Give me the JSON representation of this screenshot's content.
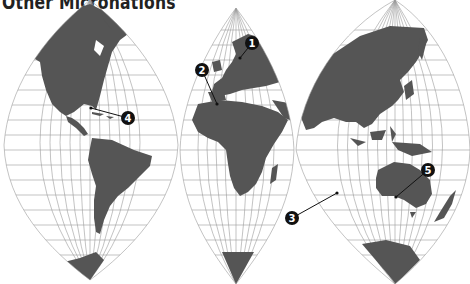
{
  "title": "Other Micronations",
  "colors": {
    "land": "#555555",
    "graticule": "#9a9a9a",
    "marker": "#111111",
    "marker_text": "#ffffff",
    "background": "#ffffff"
  },
  "map": {
    "projection": "interrupted three-lobe world map",
    "lobes": [
      {
        "id": "americas",
        "label": "North & South America"
      },
      {
        "id": "europe-africa",
        "label": "Europe & Africa"
      },
      {
        "id": "asia-oceania",
        "label": "Asia & Oceania"
      }
    ],
    "markers": [
      {
        "number": "1",
        "region": "Northern Europe / Scandinavia"
      },
      {
        "number": "2",
        "region": "Western Mediterranean"
      },
      {
        "number": "3",
        "region": "Indian Ocean"
      },
      {
        "number": "4",
        "region": "Caribbean / Gulf of Mexico"
      },
      {
        "number": "5",
        "region": "Australia"
      }
    ]
  }
}
